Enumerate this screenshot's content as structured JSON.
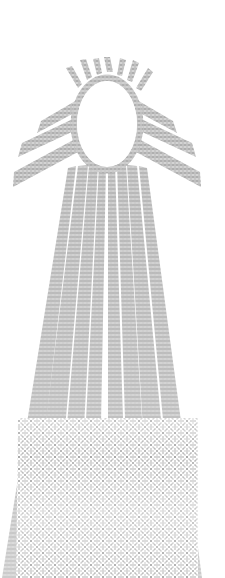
{
  "image": {
    "title": "Radiant Sun Egg",
    "description": "Monochrome dithered halftone illustration of an egg-shaped sun with rays fanning downward",
    "technique": "checkerboard-dither-halftone",
    "width": 225,
    "height": 578,
    "background_color": "#ffffff",
    "ink_color": "#6b6b6b",
    "ink_color_dark": "#4a4a4a",
    "ink_color_light": "#b4b4b4",
    "dither_cell_px": 2
  },
  "body": {
    "name": "egg-body",
    "label": "Egg",
    "cx": 107,
    "cy": 124,
    "rx": 33,
    "ry": 46,
    "outline_thickness": 7,
    "fill": "#ffffff"
  },
  "crown_spikes": {
    "name": "crown-spikes",
    "label": "Top spikes",
    "count": 7,
    "points": [
      {
        "x1": 78,
        "y1": 86,
        "x2": 68,
        "y2": 70
      },
      {
        "x1": 86,
        "y1": 78,
        "x2": 81,
        "y2": 62
      },
      {
        "x1": 96,
        "y1": 73,
        "x2": 94,
        "y2": 60
      },
      {
        "x1": 107,
        "y1": 71,
        "x2": 107,
        "y2": 58
      },
      {
        "x1": 118,
        "y1": 73,
        "x2": 121,
        "y2": 60
      },
      {
        "x1": 128,
        "y1": 78,
        "x2": 134,
        "y2": 62
      },
      {
        "x1": 136,
        "y1": 86,
        "x2": 147,
        "y2": 70
      }
    ]
  },
  "side_wings": {
    "name": "side-wings",
    "label": "Side wings",
    "count": 6,
    "items": [
      {
        "side": "left",
        "ax": 76,
        "ay": 104,
        "bx": 40,
        "by": 128,
        "width": 9
      },
      {
        "side": "left",
        "ax": 74,
        "ay": 122,
        "bx": 22,
        "by": 150,
        "width": 11
      },
      {
        "side": "left",
        "ax": 76,
        "ay": 142,
        "bx": 14,
        "by": 178,
        "width": 12
      },
      {
        "side": "right",
        "ax": 138,
        "ay": 104,
        "bx": 174,
        "by": 128,
        "width": 9
      },
      {
        "side": "right",
        "ax": 140,
        "ay": 122,
        "bx": 192,
        "by": 150,
        "width": 11
      },
      {
        "side": "right",
        "ax": 138,
        "ay": 142,
        "bx": 200,
        "by": 178,
        "width": 12
      }
    ]
  },
  "rays": {
    "name": "ray-fan",
    "label": "Downward ray fan",
    "count": 11,
    "origin_x": 107,
    "origin_y": 170,
    "items": [
      {
        "index": 0,
        "top_x": 78,
        "top_w": 10,
        "bot_x": 16,
        "bot_w": 26,
        "bot_y": 578
      },
      {
        "index": 1,
        "top_x": 86,
        "top_w": 10,
        "bot_x": 38,
        "bot_w": 26,
        "bot_y": 578
      },
      {
        "index": 2,
        "top_x": 94,
        "top_w": 9,
        "bot_x": 62,
        "bot_w": 24,
        "bot_y": 578
      },
      {
        "index": 3,
        "top_x": 101,
        "top_w": 9,
        "bot_x": 86,
        "bot_w": 22,
        "bot_y": 578
      },
      {
        "index": 4,
        "top_x": 107,
        "top_w": 9,
        "bot_x": 107,
        "bot_w": 22,
        "bot_y": 578
      },
      {
        "index": 5,
        "top_x": 113,
        "top_w": 9,
        "bot_x": 128,
        "bot_w": 22,
        "bot_y": 578
      },
      {
        "index": 6,
        "top_x": 120,
        "top_w": 9,
        "bot_x": 152,
        "bot_w": 24,
        "bot_y": 578
      },
      {
        "index": 7,
        "top_x": 128,
        "top_w": 10,
        "bot_x": 176,
        "bot_w": 26,
        "bot_y": 578
      },
      {
        "index": 8,
        "top_x": 136,
        "top_w": 10,
        "bot_x": 196,
        "bot_w": 22,
        "bot_y": 578
      },
      {
        "index": 9,
        "top_x": 70,
        "top_w": 10,
        "bot_x": 6,
        "bot_w": 22,
        "bot_y": 578
      },
      {
        "index": 10,
        "top_x": 144,
        "top_w": 10,
        "bot_x": 208,
        "bot_w": 22,
        "bot_y": 578
      }
    ]
  },
  "base_block": {
    "name": "base-block",
    "label": "Merged lower field",
    "x": 12,
    "y": 400,
    "width": 186,
    "height": 178,
    "fade_start_y": 400
  }
}
